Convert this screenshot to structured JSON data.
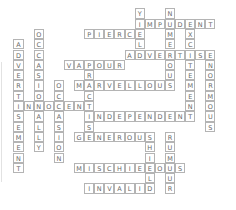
{
  "puzzle": {
    "type": "crossword",
    "grid": {
      "cell_w": 10.1,
      "cell_h": 10.3,
      "x0": 18.5,
      "y0": -2
    },
    "colors": {
      "border": "#b4b4b4",
      "letter": "#6a6a6a",
      "background": "#ffffff"
    },
    "words": [
      {
        "answer": "ADVERTISEMENT",
        "dir": "down",
        "col": 0,
        "row": 4
      },
      {
        "answer": "OCCASIONALLY",
        "dir": "down",
        "col": 2,
        "row": 3
      },
      {
        "answer": "INNOCENT",
        "dir": "across",
        "col": 0,
        "row": 10
      },
      {
        "answer": "OCCASION",
        "dir": "down",
        "col": 4,
        "row": 8
      },
      {
        "answer": "VAPOUR",
        "dir": "across",
        "col": 5,
        "row": 6
      },
      {
        "answer": "PRACTISE",
        "dir": "down",
        "col": 7,
        "row": 6
      },
      {
        "answer": "MARVELLOUS",
        "dir": "across",
        "col": 6,
        "row": 8
      },
      {
        "answer": "INDEPENDENT",
        "dir": "across",
        "col": 7,
        "row": 11
      },
      {
        "answer": "GENEROUS",
        "dir": "across",
        "col": 6,
        "row": 13
      },
      {
        "answer": "SHIELD",
        "dir": "down",
        "col": 13,
        "row": 13
      },
      {
        "answer": "MISCHIEVOUS",
        "dir": "across",
        "col": 6,
        "row": 16
      },
      {
        "answer": "RUMOUR",
        "dir": "down",
        "col": 15,
        "row": 13
      },
      {
        "answer": "INVALID",
        "dir": "across",
        "col": 7,
        "row": 18
      },
      {
        "answer": "PIERCE",
        "dir": "across",
        "col": 7,
        "row": 3
      },
      {
        "answer": "YIELD",
        "dir": "down",
        "col": 12,
        "row": 1
      },
      {
        "answer": "IMPUDENT",
        "dir": "across",
        "col": 12,
        "row": 2
      },
      {
        "answer": "NUMEROUS",
        "dir": "down",
        "col": 15,
        "row": 1
      },
      {
        "answer": "EXCITEMENT",
        "dir": "down",
        "col": 17,
        "row": 2
      },
      {
        "answer": "ADVERTISE",
        "dir": "across",
        "col": 11,
        "row": 5
      },
      {
        "answer": "ENORMOUS",
        "dir": "down",
        "col": 19,
        "row": 5
      }
    ]
  }
}
